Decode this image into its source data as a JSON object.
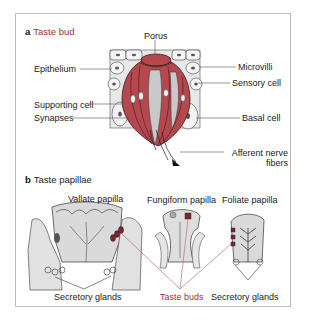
{
  "figure": {
    "panel_a": {
      "letter": "a",
      "title": "Taste bud",
      "labels": {
        "porus": "Porus",
        "epithelium": "Epithelium",
        "microvilli": "Microvilli",
        "sensory_cell": "Sensory cell",
        "supporting_cell": "Supporting cell",
        "synapses": "Synapses",
        "basal_cell": "Basal cell",
        "afferent_line1": "Afferent nerve",
        "afferent_line2": "fibers"
      }
    },
    "panel_b": {
      "letter": "b",
      "title": "Taste papillae",
      "labels": {
        "vallate": "Vallate papilla",
        "fungiform": "Fungiform papilla",
        "foliate": "Foliate papilla",
        "secretory_left": "Secretory glands",
        "taste_buds": "Taste buds",
        "secretory_right": "Secretory glands"
      }
    },
    "colors": {
      "accent_title": "#a0303a",
      "taste_bud_fill": "#b5474f",
      "tissue_gray": "#dcdcdc",
      "frame_border": "#b8bcc4"
    }
  }
}
